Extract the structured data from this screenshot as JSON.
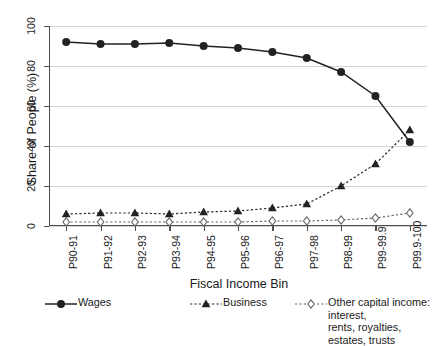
{
  "chart_data": {
    "type": "line",
    "title": "",
    "xlabel": "Fiscal Income Bin",
    "ylabel": "Share of People (%)",
    "categories": [
      "P90-91",
      "P91-92",
      "P92-93",
      "P93-94",
      "P94-95",
      "P95-96",
      "P96-97",
      "P97-98",
      "P98-99",
      "P99-99.9",
      "P99.9-100"
    ],
    "ylim": [
      0,
      100
    ],
    "yticks": [
      0,
      20,
      40,
      60,
      80,
      100
    ],
    "ytick_labels": [
      "0",
      "20",
      "40",
      "60",
      "80",
      "100"
    ],
    "grid": "horizontal",
    "legend_position": "bottom",
    "series": [
      {
        "name": "Wages",
        "marker": "filled-circle",
        "linestyle": "solid",
        "color": "#222222",
        "values": [
          92,
          91,
          91,
          91.5,
          90,
          89,
          87,
          84,
          77,
          65,
          42
        ]
      },
      {
        "name": "Business",
        "marker": "filled-triangle",
        "linestyle": "dotted",
        "color": "#222222",
        "values": [
          6,
          6.5,
          6.5,
          6,
          7,
          7.5,
          9,
          11,
          20,
          31,
          48
        ]
      },
      {
        "name": "Other capital income: interest,\nrents, royalties, estates, trusts",
        "marker": "open-diamond",
        "linestyle": "dotted",
        "color": "#666666",
        "values": [
          2,
          2,
          2,
          2,
          2,
          2,
          2.5,
          2.5,
          3,
          4,
          6.5
        ]
      }
    ]
  },
  "legend": {
    "items": [
      {
        "label": "Wages"
      },
      {
        "label": "Business"
      },
      {
        "label": "Other capital income: interest,\nrents, royalties, estates, trusts"
      }
    ]
  },
  "colors": {
    "axis": "#4d4d4d",
    "grid": "#d4d4d4",
    "wages": "#222222",
    "business": "#222222",
    "other_capital": "#666666",
    "background": "#ffffff"
  }
}
